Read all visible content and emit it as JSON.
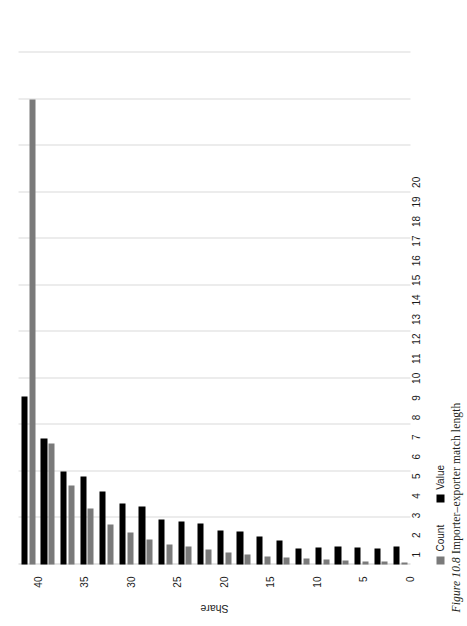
{
  "figure": {
    "number": "Figure 10.8",
    "title": "Importer–exporter match length",
    "caption_full": "Figure 10.8 Importer–exporter match length"
  },
  "legend": {
    "position": "bottom-left",
    "entries": [
      {
        "label": "Count",
        "color": "#7a7a7a",
        "icon": "square-swatch"
      },
      {
        "label": "Value",
        "color": "#000000",
        "icon": "square-swatch"
      }
    ]
  },
  "axis": {
    "value_title": "Share",
    "value_ticks": [
      0,
      5,
      10,
      15,
      20,
      25,
      30,
      35,
      40,
      45,
      50,
      55
    ],
    "value_tick_labels": [
      "0",
      "5",
      "10",
      "15",
      "20",
      "25",
      "30",
      "35",
      "40",
      "45",
      "50",
      "55"
    ],
    "category_labels": [
      "1",
      "2",
      "3",
      "4",
      "5",
      "6",
      "7",
      "8",
      "9",
      "10",
      "11",
      "12",
      "13",
      "14",
      "15",
      "16",
      "17",
      "18",
      "19",
      "20"
    ]
  },
  "chart_data": {
    "type": "bar",
    "orientation": "horizontal",
    "title": "Importer–exporter match length",
    "xlabel": "",
    "ylabel": "Share",
    "ylim": [
      0,
      55
    ],
    "grid": true,
    "legend_position": "bottom-left",
    "categories": [
      "1",
      "2",
      "3",
      "4",
      "5",
      "6",
      "7",
      "8",
      "9",
      "10",
      "11",
      "12",
      "13",
      "14",
      "15",
      "16",
      "17",
      "18",
      "19",
      "20"
    ],
    "series": [
      {
        "name": "Count",
        "color": "#7a7a7a",
        "values": [
          50.0,
          13.0,
          8.5,
          6.0,
          4.3,
          3.4,
          2.7,
          2.2,
          1.9,
          1.6,
          1.3,
          1.1,
          0.9,
          0.8,
          0.6,
          0.5,
          0.4,
          0.35,
          0.3,
          0.25
        ]
      },
      {
        "name": "Value",
        "color": "#000000",
        "values": [
          18.0,
          13.5,
          10.0,
          9.5,
          7.8,
          6.6,
          6.2,
          4.8,
          4.6,
          4.4,
          3.6,
          3.5,
          3.0,
          2.6,
          1.7,
          1.8,
          1.9,
          1.8,
          1.7,
          1.9
        ]
      }
    ]
  },
  "colors": {
    "count": "#7a7a7a",
    "value": "#000000",
    "grid": "#d9d9d9",
    "background": "#ffffff",
    "text": "#1a1a1a"
  }
}
